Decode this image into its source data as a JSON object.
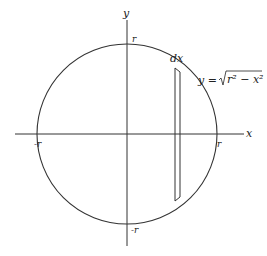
{
  "diagram": {
    "title": "",
    "axes": {
      "x_label": "x",
      "y_label": "y"
    },
    "ticks": {
      "x_neg": "-r",
      "x_pos": "r",
      "y_pos": "r",
      "y_neg": "-r"
    },
    "strip": {
      "width_label": "dx"
    },
    "curve": {
      "lhs": "y = ",
      "radicand": "r² − x²"
    },
    "colors": {
      "stroke": "#222222",
      "background": "#ffffff"
    }
  }
}
